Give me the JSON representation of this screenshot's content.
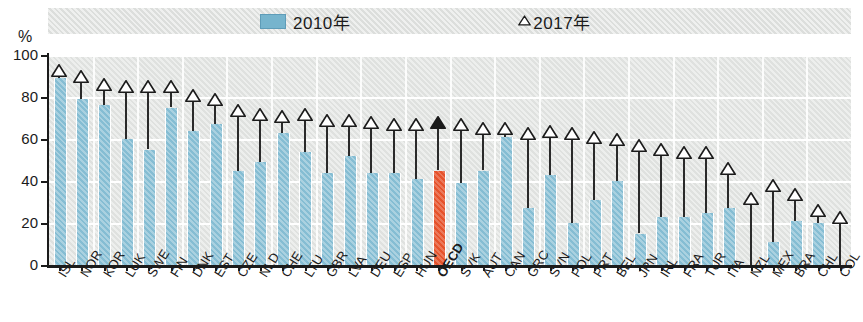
{
  "units": {
    "y_unit": "%"
  },
  "legend": {
    "items": [
      {
        "label": "2010年",
        "marker": "bar-swatch",
        "color": "#76b4cd"
      },
      {
        "label": "△2017年",
        "marker": "triangle-outline",
        "color": "#ffffff"
      }
    ],
    "bar_label": "2010年",
    "triangle_label": "2017年"
  },
  "colors": {
    "bar": "#85bdd3",
    "bar_highlight": "#e6522b",
    "plot_background": "#dfe1df",
    "gridline": "#ffffff",
    "axis": "#1b1b1b",
    "marker_outline": "#2a2a2a",
    "marker_fill_highlight": "#1b1b1b"
  },
  "chart_data": {
    "type": "bar",
    "title": "",
    "subtitle": "",
    "xlabel": "",
    "ylabel": "%",
    "ylim": [
      0,
      100
    ],
    "yticks": [
      0,
      20,
      40,
      60,
      80,
      100
    ],
    "grid": true,
    "legend_position": "top",
    "categories": [
      "ISL",
      "NOR",
      "KOR",
      "LUK",
      "SWE",
      "FIN",
      "DNK",
      "EST",
      "CZE",
      "NLD",
      "CHE",
      "LTU",
      "GBR",
      "LVA",
      "DEU",
      "ESP",
      "HUN",
      "OECD",
      "SVK",
      "AUT",
      "CAN",
      "GRC",
      "SVN",
      "POL",
      "PRT",
      "BEL",
      "JPN",
      "IRL",
      "FRA",
      "TUR",
      "ITA",
      "NZL",
      "MEX",
      "BRA",
      "CHL",
      "COL"
    ],
    "highlight_category": "OECD",
    "series": [
      {
        "name": "2010年",
        "type": "bar",
        "values": [
          89,
          79,
          76,
          60,
          55,
          75,
          64,
          67,
          45,
          49,
          63,
          54,
          44,
          52,
          44,
          44,
          41,
          45,
          39,
          45,
          61,
          27,
          43,
          20,
          31,
          40,
          15,
          23,
          23,
          25,
          27,
          null,
          11,
          21,
          20,
          null
        ]
      },
      {
        "name": "2017年",
        "type": "marker-triangle",
        "values": [
          94,
          91,
          87,
          86,
          86,
          86,
          82,
          80,
          75,
          73,
          72,
          73,
          70,
          70,
          69,
          68,
          68,
          69,
          68,
          66,
          66,
          64,
          65,
          64,
          62,
          61,
          58,
          56,
          55,
          55,
          47,
          33,
          39,
          35,
          27,
          24
        ]
      }
    ]
  }
}
